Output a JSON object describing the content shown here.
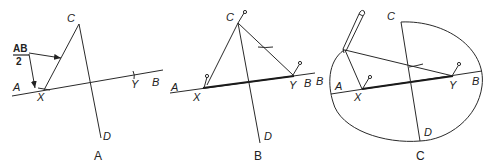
{
  "figure": {
    "panels": [
      {
        "caption": "A",
        "labels": {
          "C": "C",
          "A": "A",
          "B": "B",
          "X": "X",
          "Y": "Y",
          "D": "D"
        },
        "annotation": {
          "numerator": "AB",
          "denominator": "2"
        }
      },
      {
        "caption": "B",
        "labels": {
          "C": "C",
          "A": "A",
          "B": "B",
          "X": "X",
          "Y": "Y",
          "D": "D"
        }
      },
      {
        "caption": "C",
        "labels": {
          "C_top": "C",
          "C_bottom": "C",
          "A": "A",
          "B": "B",
          "X": "X",
          "Y": "Y",
          "D": "D",
          "B_left": "B"
        }
      }
    ],
    "colors": {
      "ink": "#2a2a2a",
      "background": "#ffffff"
    }
  }
}
